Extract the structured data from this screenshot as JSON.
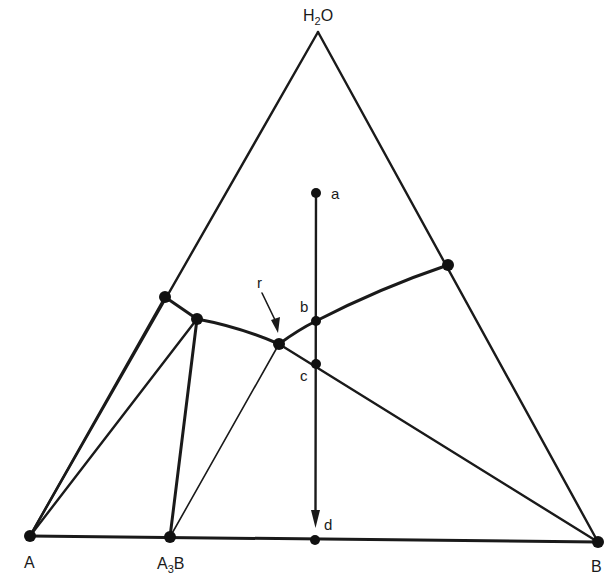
{
  "diagram": {
    "type": "ternary-phase-diagram",
    "colors": {
      "line": "#1a1a1a",
      "point": "#111111",
      "background": "#ffffff"
    },
    "vertices": {
      "top": {
        "label": "H",
        "subscript": "2",
        "suffix": "O",
        "full": "H2O"
      },
      "left": {
        "label": "A"
      },
      "right": {
        "label": "B"
      },
      "compound": {
        "label": "A",
        "subscript": "3",
        "suffix": "B",
        "full": "A3B"
      }
    },
    "path_points": {
      "a": {
        "label": "a"
      },
      "b": {
        "label": "b"
      },
      "c": {
        "label": "c"
      },
      "d": {
        "label": "d"
      },
      "r": {
        "label": "r"
      }
    },
    "segments": [
      {
        "from": "H2O",
        "to": "A",
        "kind": "triangle-edge"
      },
      {
        "from": "H2O",
        "to": "B",
        "kind": "triangle-edge"
      },
      {
        "from": "A",
        "to": "B",
        "kind": "triangle-edge"
      },
      {
        "from": "A",
        "to": "P1",
        "kind": "tie-line"
      },
      {
        "from": "A",
        "to": "P2",
        "kind": "tie-line"
      },
      {
        "from": "A3B",
        "to": "P2",
        "kind": "tie-line"
      },
      {
        "from": "A3B",
        "to": "r",
        "kind": "tie-line-thin"
      },
      {
        "from": "P1",
        "to": "P2",
        "kind": "solubility-curve"
      },
      {
        "from": "P2",
        "to": "r",
        "kind": "solubility-curve"
      },
      {
        "from": "r",
        "to": "b",
        "kind": "solubility-curve"
      },
      {
        "from": "b",
        "to": "P3",
        "kind": "solubility-curve"
      },
      {
        "from": "r",
        "to": "B",
        "kind": "tie-line"
      },
      {
        "from": "a",
        "to": "d",
        "kind": "crystallization-path-arrow"
      }
    ]
  }
}
